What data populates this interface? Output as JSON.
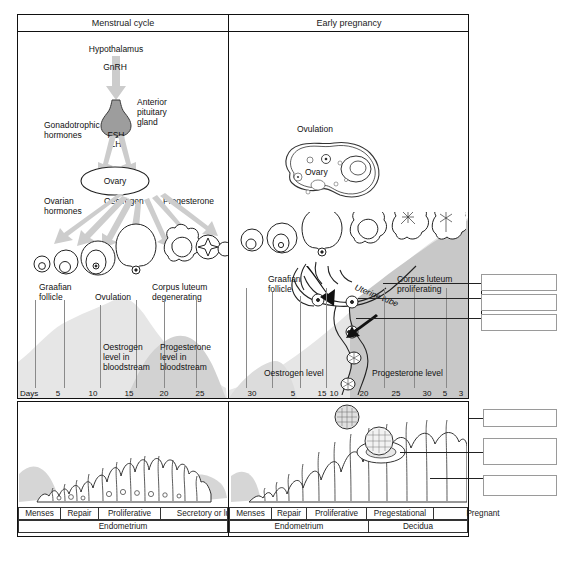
{
  "figure": {
    "type": "biological-diagram",
    "title_left": "Menstrual cycle",
    "title_right": "Early pregnancy",
    "days_axis_label": "Days"
  },
  "colors": {
    "ink": "#1a1a1a",
    "rule": "#333333",
    "arrow_grey": "#c9c9c9",
    "pituitary_grey": "#9a9a9a",
    "band_light": "#e3e3e3",
    "band_mid": "#cfcfcf",
    "band_dark": "#bdbdbd",
    "blank_box_border": "#9a9a9a",
    "gridline": "#8a8a8a"
  },
  "left_panel": {
    "header": "Menstrual cycle",
    "labels": {
      "hypothalamus": "Hypothalamus",
      "gnrh": "GnRH",
      "anterior_pituitary": "Anterior\npituitary\ngland",
      "gonadotrophic": "Gonadotrophic\nhormones",
      "fsh": "FSH",
      "lh": "LH",
      "ovary": "Ovary",
      "ovarian_hormones": "Ovarian\nhormones",
      "oestrogen": "Oestrogen",
      "progesterone": "Progesterone",
      "graafian_follicle": "Graafian\nfollicle",
      "ovulation": "Ovulation",
      "corpus_luteum_degenerating": "Corpus luteum\ndegenerating",
      "oestrogen_level": "Oestrogen\nlevel in\nbloodstream",
      "progesterone_level": "Progesterone\nlevel in\nbloodstream"
    }
  },
  "right_panel": {
    "header": "Early pregnancy",
    "labels": {
      "ovulation": "Ovulation",
      "ovary": "Ovary",
      "graafian_follicle": "Graafian\nfollicle",
      "corpus_luteum_proliferating": "Corpus luteum\nproliferating",
      "uterine_tube": "Uterine tube",
      "oestrogen_level": "Oestrogen level",
      "progesterone_level": "Progesterone level"
    }
  },
  "chart_data": {
    "type": "area",
    "xlabel": "Days",
    "ylabel": "",
    "grid": false,
    "legend_position": "inline-annotations",
    "x_ticks_left": [
      "5",
      "10",
      "15",
      "20",
      "25"
    ],
    "x_ticks_right": [
      "30",
      "5",
      "15",
      "10",
      "20",
      "25",
      "30",
      "5",
      "3"
    ],
    "series": [
      {
        "name": "Oestrogen level",
        "note": "rises to ovulation peak then falls, rises again in pregnancy"
      },
      {
        "name": "Progesterone level",
        "note": "rises after ovulation (luteal), falls before menses, rises steadily in pregnancy"
      }
    ]
  },
  "days_ticks": [
    {
      "label": "5",
      "x": 58
    },
    {
      "label": "10",
      "x": 93
    },
    {
      "label": "15",
      "x": 129
    },
    {
      "label": "20",
      "x": 164
    },
    {
      "label": "25",
      "x": 200
    },
    {
      "label": "30",
      "x": 252
    },
    {
      "label": "5",
      "x": 293
    },
    {
      "label": "15",
      "x": 322
    },
    {
      "label": "10",
      "x": 334
    },
    {
      "label": "20",
      "x": 364
    },
    {
      "label": "25",
      "x": 396
    },
    {
      "label": "30",
      "x": 427
    },
    {
      "label": "5",
      "x": 445
    },
    {
      "label": "3",
      "x": 461
    }
  ],
  "endometrium_rows": {
    "left_phases": [
      {
        "label": "Menses",
        "width": 42
      },
      {
        "label": "Repair",
        "width": 38
      },
      {
        "label": "Proliferative",
        "width": 62
      },
      {
        "label": "Secretory or luteal",
        "width": 98
      }
    ],
    "right_phases": [
      {
        "label": "Menses",
        "width": 42
      },
      {
        "label": "Repair",
        "width": 35
      },
      {
        "label": "Proliferative",
        "width": 60
      },
      {
        "label": "Pregestational",
        "width": 67
      },
      {
        "label": "Pregnant",
        "width": 98
      }
    ],
    "tissue_left": "Endometrium",
    "tissue_right_a": "Endometrium",
    "tissue_right_b": "Decidua"
  },
  "callout_boxes": {
    "upper": [
      {
        "id": "callout-1",
        "text": ""
      },
      {
        "id": "callout-2",
        "text": ""
      },
      {
        "id": "callout-3",
        "text": ""
      }
    ],
    "lower": [
      {
        "id": "callout-4",
        "text": ""
      },
      {
        "id": "callout-5",
        "text": ""
      },
      {
        "id": "callout-6",
        "text": ""
      }
    ]
  }
}
